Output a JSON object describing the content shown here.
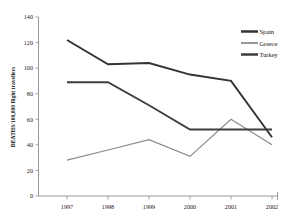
{
  "chart_data": {
    "type": "line",
    "title": "",
    "xlabel": "",
    "ylabel": "DEATHS/100,000 flight travellers",
    "categories": [
      "1997",
      "1998",
      "1999",
      "2000",
      "2001",
      "2002"
    ],
    "x": [
      1997,
      1998,
      1999,
      2000,
      2001,
      2002
    ],
    "xlim": [
      1996.5,
      2002.6
    ],
    "ylim": [
      0,
      140
    ],
    "yticks": [
      0,
      20,
      40,
      60,
      80,
      100,
      120,
      140
    ],
    "ytick_labels": [
      "0",
      "20",
      "40",
      "60",
      "80",
      "100",
      "120",
      "140"
    ],
    "grid": false,
    "legend_position": "top-right",
    "series": [
      {
        "name": "Spain",
        "color": "#333333",
        "values": [
          122,
          103,
          104,
          95,
          90,
          46
        ]
      },
      {
        "name": "Greece",
        "color": "#8a8a8a",
        "values": [
          28,
          36,
          44,
          31,
          60,
          40
        ]
      },
      {
        "name": "Turkey",
        "color": "#3d3d3d",
        "values": [
          89,
          89,
          71,
          52,
          52,
          52
        ]
      }
    ]
  },
  "legend": {
    "entries": [
      {
        "label": "Spain"
      },
      {
        "label": "Greece"
      },
      {
        "label": "Turkey"
      }
    ]
  },
  "axes": {
    "y_axis_title": "DEATHS/100,000 flight travellers",
    "y_tick_labels": [
      "140",
      "120",
      "100",
      "80",
      "60",
      "40",
      "20",
      "0"
    ],
    "x_tick_labels": [
      "1997",
      "1998",
      "1999",
      "2000",
      "2001",
      "2002"
    ]
  },
  "colors": {
    "spain": "#333333",
    "greece": "#8a8a8a",
    "turkey": "#3d3d3d",
    "axis": "#8c8c8c",
    "text": "#111111",
    "background": "#ffffff"
  }
}
